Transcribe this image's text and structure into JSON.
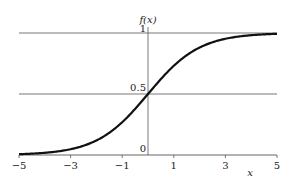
{
  "chart_data": {
    "type": "line",
    "title": "",
    "xlabel": "x",
    "ylabel": "f(x)",
    "xlim": [
      -5,
      5
    ],
    "ylim": [
      0,
      1
    ],
    "x_ticks": [
      -5,
      -3,
      -1,
      1,
      3,
      5
    ],
    "x_tick_labels": [
      "−5",
      "−3",
      "−1",
      "1",
      "3",
      "5"
    ],
    "y_ticks": [
      0,
      0.5,
      1
    ],
    "y_tick_labels": [
      "0",
      "0.5",
      "1"
    ],
    "grid": {
      "horizontal": [
        0.5,
        1
      ],
      "vertical": [
        0
      ]
    },
    "legend": null,
    "series": [
      {
        "name": "f(x) = 1/(1+e^-x)",
        "function": "logistic",
        "x": [
          -5,
          -4,
          -3,
          -2,
          -1,
          0,
          1,
          2,
          3,
          4,
          5
        ],
        "values": [
          0.007,
          0.018,
          0.047,
          0.119,
          0.269,
          0.5,
          0.731,
          0.881,
          0.953,
          0.982,
          0.993
        ]
      }
    ],
    "colors": {
      "curve": "#111111",
      "axes": "#555555"
    }
  }
}
